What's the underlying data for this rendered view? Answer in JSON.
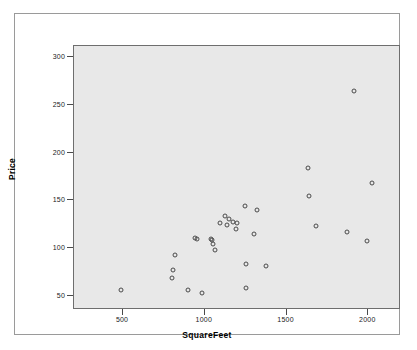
{
  "chart_data": {
    "type": "scatter",
    "title": "",
    "xlabel": "SquareFeet",
    "ylabel": "Price",
    "xlim": [
      200,
      2200
    ],
    "ylim": [
      35,
      312
    ],
    "xticks": [
      500,
      1000,
      1500,
      2000
    ],
    "yticks": [
      50,
      100,
      150,
      200,
      250,
      300
    ],
    "grid": false,
    "legend": null,
    "marker": "open-circle",
    "marker_color": "#4a4a4a",
    "plot_background": "#e8e8e8",
    "figure_background": "#ffffff",
    "points": [
      {
        "x": 490,
        "y": 56
      },
      {
        "x": 800,
        "y": 69
      },
      {
        "x": 805,
        "y": 77
      },
      {
        "x": 815,
        "y": 93
      },
      {
        "x": 895,
        "y": 56
      },
      {
        "x": 940,
        "y": 111
      },
      {
        "x": 950,
        "y": 109
      },
      {
        "x": 980,
        "y": 53
      },
      {
        "x": 1035,
        "y": 110
      },
      {
        "x": 1045,
        "y": 108
      },
      {
        "x": 1050,
        "y": 104
      },
      {
        "x": 1065,
        "y": 98
      },
      {
        "x": 1095,
        "y": 126
      },
      {
        "x": 1125,
        "y": 134
      },
      {
        "x": 1135,
        "y": 124
      },
      {
        "x": 1150,
        "y": 130
      },
      {
        "x": 1175,
        "y": 127
      },
      {
        "x": 1190,
        "y": 120
      },
      {
        "x": 1195,
        "y": 126
      },
      {
        "x": 1245,
        "y": 144
      },
      {
        "x": 1250,
        "y": 83
      },
      {
        "x": 1255,
        "y": 58
      },
      {
        "x": 1300,
        "y": 115
      },
      {
        "x": 1320,
        "y": 140
      },
      {
        "x": 1375,
        "y": 81
      },
      {
        "x": 1630,
        "y": 184
      },
      {
        "x": 1640,
        "y": 155
      },
      {
        "x": 1680,
        "y": 123
      },
      {
        "x": 1870,
        "y": 117
      },
      {
        "x": 1915,
        "y": 265
      },
      {
        "x": 1990,
        "y": 107
      },
      {
        "x": 2020,
        "y": 168
      }
    ]
  },
  "axes": {
    "y_title": "Price",
    "x_title": "SquareFeet",
    "y_tick_labels": [
      "300",
      "250",
      "200",
      "150",
      "100",
      "50"
    ],
    "x_tick_labels": [
      "500",
      "1000",
      "1500",
      "2000"
    ]
  }
}
